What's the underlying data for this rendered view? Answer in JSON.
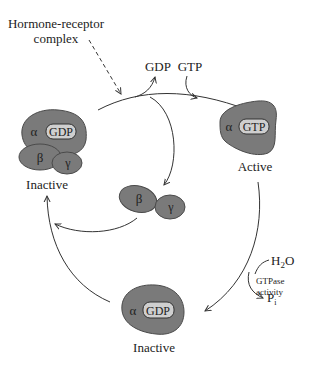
{
  "colors": {
    "protein_fill": "#7a7a7a",
    "protein_stroke": "#4a4a4a",
    "nucleotide_fill": "#cfcfcf",
    "arrow": "#333333",
    "text": "#222222",
    "background": "#ffffff"
  },
  "labels": {
    "hormone_receptor_line1": "Hormone-receptor",
    "hormone_receptor_line2": "complex",
    "gdp_released": "GDP",
    "gtp_bound": "GTP",
    "water": "H₂O",
    "water_base": "H",
    "water_sub": "2",
    "water_tail": "O",
    "gtpase_line1": "GTPase",
    "gtpase_line2": "activity",
    "phosphate_base": "P",
    "phosphate_sub": "i"
  },
  "states": {
    "inactive_trimer": {
      "alpha": "α",
      "nucleotide": "GDP",
      "beta": "β",
      "gamma": "γ",
      "caption": "Inactive"
    },
    "active_alpha": {
      "alpha": "α",
      "nucleotide": "GTP",
      "caption": "Active"
    },
    "beta_gamma_free": {
      "beta": "β",
      "gamma": "γ"
    },
    "inactive_alpha": {
      "alpha": "α",
      "nucleotide": "GDP",
      "caption": "Inactive"
    }
  }
}
